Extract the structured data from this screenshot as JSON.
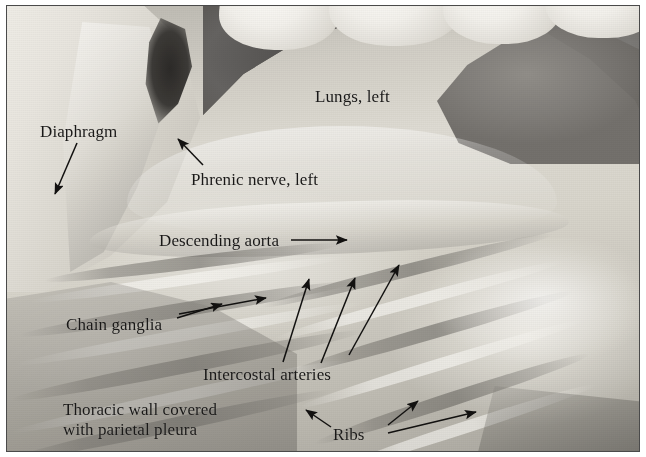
{
  "figure": {
    "kind": "anatomical-dissection-photograph",
    "border_color": "#4a4a4a",
    "text_color": "#1b1a19",
    "background_color": "#ffffff"
  },
  "labels": [
    {
      "id": "diaphragm",
      "text": "Diaphragm",
      "x": 33,
      "y": 116
    },
    {
      "id": "lungs-left",
      "text": "Lungs, left",
      "x": 308,
      "y": 81
    },
    {
      "id": "phrenic-nerve",
      "text": "Phrenic nerve, left",
      "x": 184,
      "y": 164
    },
    {
      "id": "descending-aorta",
      "text": "Descending aorta",
      "x": 152,
      "y": 225
    },
    {
      "id": "chain-ganglia",
      "text": "Chain ganglia",
      "x": 59,
      "y": 309
    },
    {
      "id": "intercostal",
      "text": "Intercostal arteries",
      "x": 196,
      "y": 359
    },
    {
      "id": "thoracic-wall-1",
      "text": "Thoracic wall covered",
      "x": 56,
      "y": 394
    },
    {
      "id": "thoracic-wall-2",
      "text": "with parietal pleura",
      "x": 56,
      "y": 414
    },
    {
      "id": "ribs",
      "text": "Ribs",
      "x": 326,
      "y": 419
    }
  ],
  "leaders": [
    {
      "id": "arrow-diaphragm",
      "from": [
        70,
        137
      ],
      "to": [
        48,
        188
      ]
    },
    {
      "id": "arrow-phrenic",
      "from": [
        196,
        159
      ],
      "to": [
        171,
        133
      ]
    },
    {
      "id": "arrow-aorta",
      "from": [
        284,
        234
      ],
      "to": [
        340,
        234
      ]
    },
    {
      "id": "arrow-ganglia-upper",
      "from": [
        172,
        308
      ],
      "to": [
        259,
        292
      ]
    },
    {
      "id": "arrow-ganglia-lower",
      "from": [
        170,
        312
      ],
      "to": [
        215,
        298
      ]
    },
    {
      "id": "arrow-intercostal-1",
      "from": [
        276,
        356
      ],
      "to": [
        302,
        273
      ]
    },
    {
      "id": "arrow-intercostal-2",
      "from": [
        314,
        357
      ],
      "to": [
        348,
        272
      ]
    },
    {
      "id": "arrow-intercostal-3",
      "from": [
        342,
        349
      ],
      "to": [
        392,
        259
      ]
    },
    {
      "id": "arrow-ribs-left",
      "from": [
        324,
        421
      ],
      "to": [
        299,
        404
      ]
    },
    {
      "id": "arrow-ribs-upper",
      "from": [
        381,
        419
      ],
      "to": [
        411,
        395
      ]
    },
    {
      "id": "arrow-ribs-right",
      "from": [
        381,
        427
      ],
      "to": [
        469,
        406
      ]
    }
  ]
}
